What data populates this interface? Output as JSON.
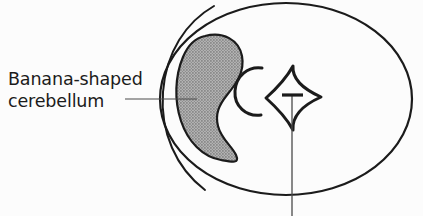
{
  "figure": {
    "name": "banana-shaped-cerebellum-diagram",
    "background_color": "#fcfcfc",
    "ink_color": "#1b1b1b",
    "width": 423,
    "height": 216
  },
  "annotation": {
    "label_line_1": "Banana-shaped",
    "label_line_2": "cerebellum",
    "full_text": "Banana-shaped cerebellum",
    "text_color": "#1b1b1b"
  },
  "shapes": {
    "outer_outline": {
      "name": "head-outline-ellipse",
      "description": "large outer ellipse representing the skull / head cross-section",
      "stroke_color": "#1b1b1b",
      "stroke_width": 2.2,
      "fill": "none",
      "center_x": 286,
      "center_y": 99,
      "radius_x": 126,
      "radius_y": 96
    },
    "cerebellum": {
      "name": "cerebellum-crescent",
      "description": "banana / crescent shaped cerebellum, gray halftone fill",
      "stroke_color": "#1b1b1b",
      "stroke_width": 2.2,
      "fill_color": "#9a9a9a",
      "fill_pattern": "halftone-dots"
    },
    "inner_arc": {
      "name": "inner-arc-outline",
      "description": "thin arc lying just left of and parallel to the cerebellum",
      "stroke_color": "#1b1b1b",
      "stroke_width": 2.0,
      "fill": "none"
    },
    "c_shape": {
      "name": "c-shaped-structure",
      "description": "open C-shaped curve to the right of the cerebellum (brainstem region)",
      "stroke_color": "#1b1b1b",
      "stroke_width": 3.0,
      "fill": "none"
    },
    "diamond": {
      "name": "diamond-star-structure",
      "description": "four-pointed star / diamond with concave sides (ventricle region)",
      "stroke_color": "#1b1b1b",
      "stroke_width": 3.0,
      "fill": "none"
    }
  },
  "leader_lines": {
    "label_leader": {
      "name": "label-leader-line",
      "description": "horizontal leader from the text label into the cerebellum",
      "stroke_color": "#4a4a4a",
      "stroke_width": 1.2,
      "x1": 125,
      "y1": 99,
      "x2": 197,
      "y2": 99
    },
    "diamond_leader": {
      "name": "diamond-leader-line",
      "description": "vertical leader running down from a T-marker in the diamond, exiting the bottom of the frame",
      "stroke_color": "#4a4a4a",
      "stroke_width": 1.3,
      "x1": 292,
      "y1": 96,
      "x2": 292,
      "y2": 216
    },
    "diamond_tick": {
      "name": "diamond-leader-tick",
      "description": "short horizontal tick forming the top bar of the T marker",
      "stroke_color": "#1b1b1b",
      "stroke_width": 3.2,
      "x1": 282,
      "y1": 95,
      "x2": 303,
      "y2": 95
    }
  }
}
